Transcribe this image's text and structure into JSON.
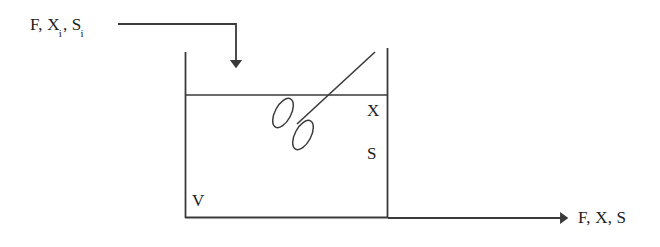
{
  "diagram": {
    "kind": "process-flow-diagram",
    "stroke_color": "#3a3a3a",
    "background_color": "#ffffff",
    "labels": {
      "inlet_prefix": "F, X",
      "inlet_sub_1": "i",
      "inlet_mid": ", S",
      "inlet_sub_2": "i",
      "inlet_full": "F, Xi, Si",
      "outlet": "F, X, S",
      "biomass": "X",
      "substrate": "S",
      "volume": "V"
    },
    "parts": {
      "tank": "tank-vessel",
      "liquid_surface": "liquid-surface-line",
      "impeller": "impeller-blades",
      "shaft": "impeller-shaft",
      "inlet_stream": "inlet-stream-arrow",
      "outlet_stream": "outlet-stream-arrow"
    },
    "geometry": {
      "tank_left_x": 185,
      "tank_right_x": 388,
      "tank_top_y": 52,
      "tank_bottom_y": 218,
      "liquid_surface_y": 95,
      "inlet_line_y": 24,
      "inlet_drop_x": 236,
      "inlet_arrow_tip_y": 70,
      "outlet_line_y": 218,
      "outlet_arrow_tip_x": 570
    }
  }
}
